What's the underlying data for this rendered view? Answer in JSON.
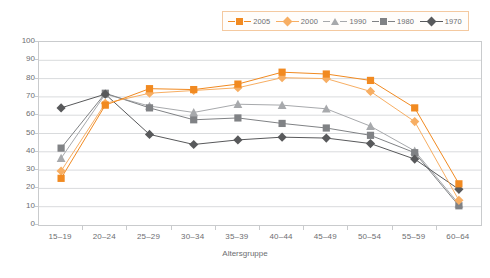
{
  "chart_data": {
    "type": "line",
    "title": "",
    "xlabel": "Altersgruppe",
    "ylabel": "Prozent",
    "ylim": [
      0,
      100
    ],
    "ytick_step": 10,
    "yticks": [
      100,
      90,
      80,
      70,
      60,
      50,
      40,
      30,
      20,
      10,
      0
    ],
    "grid": "horizontal",
    "legend_position": "top-right",
    "categories": [
      "15–19",
      "20–24",
      "25–29",
      "30–34",
      "35–39",
      "40–44",
      "45–49",
      "50–54",
      "55–59",
      "60–64"
    ],
    "series": [
      {
        "name": "2005",
        "color": "#F18A21",
        "marker": "square",
        "values": [
          25.5,
          65.5,
          74.5,
          74.0,
          77.0,
          83.5,
          82.5,
          79.0,
          64.0,
          22.5
        ]
      },
      {
        "name": "2000",
        "color": "#F7AE63",
        "marker": "diamond",
        "values": [
          29.5,
          66.5,
          72.0,
          73.5,
          75.0,
          80.5,
          80.0,
          73.0,
          56.5,
          13.5
        ]
      },
      {
        "name": "1990",
        "color": "#A7A9AC",
        "marker": "triangle",
        "values": [
          36.5,
          71.5,
          65.0,
          61.5,
          66.0,
          65.5,
          63.5,
          54.0,
          40.5,
          11.5
        ]
      },
      {
        "name": "1980",
        "color": "#808285",
        "marker": "square",
        "values": [
          42.0,
          72.0,
          64.0,
          57.5,
          58.5,
          55.5,
          53.0,
          49.0,
          39.5,
          10.5
        ]
      },
      {
        "name": "1970",
        "color": "#58595B",
        "marker": "diamond",
        "values": [
          64.0,
          71.5,
          49.5,
          44.0,
          46.5,
          48.0,
          47.5,
          44.5,
          36.0,
          19.5
        ]
      }
    ]
  },
  "legend": {
    "items": [
      {
        "label": "2005",
        "color": "#F18A21",
        "marker": "square"
      },
      {
        "label": "2000",
        "color": "#F7AE63",
        "marker": "diamond"
      },
      {
        "label": "1990",
        "color": "#A7A9AC",
        "marker": "triangle"
      },
      {
        "label": "1980",
        "color": "#808285",
        "marker": "square"
      },
      {
        "label": "1970",
        "color": "#58595B",
        "marker": "diamond"
      }
    ]
  }
}
